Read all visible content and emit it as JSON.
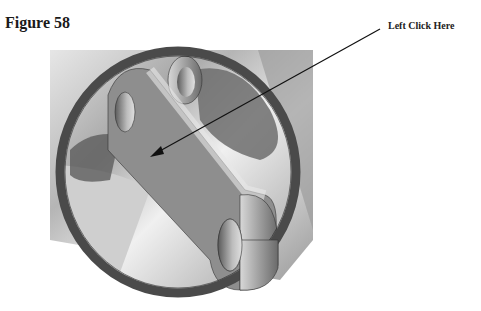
{
  "figure": {
    "title": "Figure 58",
    "callout_label": "Left Click Here"
  },
  "illustration": {
    "description": "3D CAD render of a flat link/bracket with two bored bosses inside a circular ring over a cylindrical body",
    "colors": {
      "ring": "#4a4a4a",
      "link_face": "#8e8e8e",
      "background_body": "#c8c8c8",
      "arrow": "#111111"
    }
  }
}
